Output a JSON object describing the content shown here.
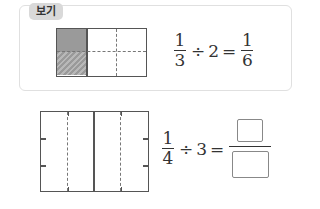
{
  "example": {
    "label": "보기",
    "equation": {
      "left": {
        "numerator": "1",
        "denominator": "3"
      },
      "operator": "÷",
      "divisor": "2",
      "equals": "=",
      "result": {
        "numerator": "1",
        "denominator": "6"
      }
    }
  },
  "problem": {
    "equation": {
      "left": {
        "numerator": "1",
        "denominator": "4"
      },
      "operator": "÷",
      "divisor": "3",
      "equals": "="
    },
    "answer": {
      "numerator": "",
      "denominator": ""
    }
  }
}
